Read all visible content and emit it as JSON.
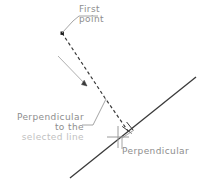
{
  "diagram": {
    "background_color": "#ffffff",
    "line_color": "#3a3a3a",
    "leader_color": "#9a9a9a",
    "text_color": "#8d8d8d",
    "width": 201,
    "height": 182,
    "labels": {
      "first_point": {
        "line1": "First",
        "line2": "point"
      },
      "perpendicular_to_selected": {
        "line1": "Perpendicular",
        "line2": "to the",
        "line3": "selected line"
      },
      "perpendicular_marker": {
        "line1": "Perpendicular"
      }
    },
    "geometry": {
      "first_point_marker": {
        "x": 62,
        "y": 33,
        "size": 3,
        "shape": "square-dot"
      },
      "dashed_polyline": [
        {
          "x": 62,
          "y": 33
        },
        {
          "x": 105,
          "y": 98
        },
        {
          "x": 128,
          "y": 131
        }
      ],
      "direction_arrow": {
        "from": {
          "x": 58,
          "y": 56
        },
        "to": {
          "x": 88,
          "y": 87
        },
        "style": "thin-open-arrow"
      },
      "solid_line": {
        "from": {
          "x": 70,
          "y": 178
        },
        "to": {
          "x": 196,
          "y": 77
        },
        "label": "selected line"
      },
      "perpendicular_marker": {
        "x": 128,
        "y": 131,
        "symbol": "right-angle-tick"
      },
      "crosshair": {
        "x": 118,
        "y": 137,
        "arm": 11
      },
      "leader_first_point": [
        {
          "x": 62,
          "y": 33
        },
        {
          "x": 72,
          "y": 21
        },
        {
          "x": 78,
          "y": 16
        },
        {
          "x": 97,
          "y": 16
        }
      ],
      "leader_perp_selected": [
        {
          "x": 84,
          "y": 125
        },
        {
          "x": 93,
          "y": 125
        },
        {
          "x": 106,
          "y": 99
        }
      ],
      "leader_perpendicular": [
        {
          "x": 122,
          "y": 148
        },
        {
          "x": 122,
          "y": 138
        },
        {
          "x": 133,
          "y": 131
        }
      ]
    }
  }
}
